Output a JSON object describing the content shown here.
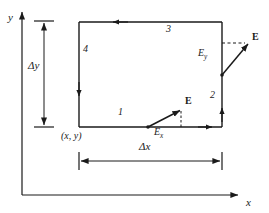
{
  "figure": {
    "background_color": "#ffffff",
    "line_color": "#1a1a1a",
    "width": 269,
    "height": 213
  },
  "axes": {
    "y_label": "y",
    "x_label": "x",
    "origin": {
      "x": 22,
      "y": 195
    },
    "y_axis_top": {
      "x": 22,
      "y": 10
    },
    "x_axis_right": {
      "x": 240,
      "y": 195
    }
  },
  "rectangle": {
    "left": 79,
    "right": 222,
    "top": 22,
    "bottom": 127,
    "corner_label": "(x, y)",
    "sides": [
      {
        "name": "bottom-side",
        "label": "1",
        "direction": "right",
        "label_x": 118,
        "label_y": 112
      },
      {
        "name": "right-side",
        "label": "2",
        "direction": "up",
        "label_x": 210,
        "label_y": 95
      },
      {
        "name": "top-side",
        "label": "3",
        "direction": "left",
        "label_x": 166,
        "label_y": 27
      },
      {
        "name": "left-side",
        "label": "4",
        "direction": "down",
        "label_x": 84,
        "label_y": 48
      }
    ]
  },
  "dimensions": [
    {
      "name": "delta-y",
      "label": "Δy",
      "orientation": "vertical",
      "label_x": 28,
      "label_y": 66
    },
    {
      "name": "delta-x",
      "label": "Δx",
      "orientation": "horizontal",
      "label_x": 139,
      "label_y": 147
    }
  ],
  "vectors": [
    {
      "name": "e-vector-bottom",
      "label": "E",
      "label_x": 185,
      "label_y": 101,
      "component_label": "E",
      "component_subscript": "x",
      "component_label_x": 156,
      "component_label_y": 131,
      "tail": {
        "x": 148,
        "y": 127
      },
      "head": {
        "x": 181,
        "y": 110
      },
      "dashed_from": {
        "x": 181,
        "y": 110
      },
      "dashed_to": {
        "x": 181,
        "y": 127
      }
    },
    {
      "name": "e-vector-right",
      "label": "E",
      "label_x": 252,
      "label_y": 37,
      "component_label": "E",
      "component_subscript": "y",
      "component_label_x": 200,
      "component_label_y": 52,
      "tail": {
        "x": 222,
        "y": 75
      },
      "head": {
        "x": 249,
        "y": 43
      },
      "dashed_from": {
        "x": 222,
        "y": 43
      },
      "dashed_to": {
        "x": 245,
        "y": 43
      }
    }
  ]
}
